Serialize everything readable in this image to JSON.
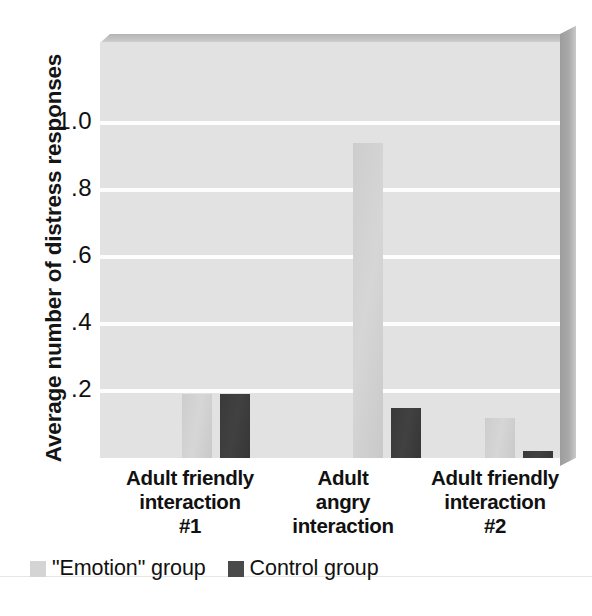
{
  "chart_data": {
    "type": "bar",
    "title": "",
    "subtitle": "",
    "xlabel": "",
    "ylabel": "Average number of distress responses",
    "categories": [
      "Adult friendly\ninteraction\n#1",
      "Adult\nangry\ninteraction",
      "Adult friendly\ninteraction\n#2"
    ],
    "category_lines": [
      [
        "Adult friendly",
        "interaction",
        "#1"
      ],
      [
        "Adult",
        "angry",
        "interaction"
      ],
      [
        "Adult friendly",
        "interaction",
        "#2"
      ]
    ],
    "series": [
      {
        "name": "\"Emotion\" group",
        "color": "#d4d4d4",
        "values": [
          0.19,
          0.94,
          0.12
        ]
      },
      {
        "name": "Control group",
        "color": "#3a3a3a",
        "values": [
          0.19,
          0.15,
          0.02
        ]
      }
    ],
    "ylim": [
      0,
      1.24
    ],
    "yticks": [
      0.2,
      0.4,
      0.6,
      0.8,
      1.0
    ],
    "ytick_labels": [
      ".2",
      ".4",
      ".6",
      ".8",
      "1.0"
    ],
    "grid": true,
    "grid_color": "#ffffff",
    "legend_position": "bottom-left",
    "plot_background": "#e2e2e2"
  },
  "legend": {
    "items": [
      {
        "label": "\"Emotion\" group",
        "swatch": "emotion"
      },
      {
        "label": "Control group",
        "swatch": "control"
      }
    ]
  }
}
